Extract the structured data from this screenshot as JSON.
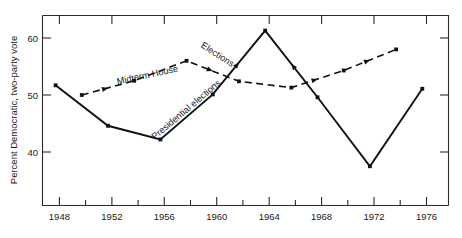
{
  "chart_data": {
    "type": "line",
    "title": "",
    "xlabel": "",
    "ylabel": "Percent Democratic, two-party vote",
    "xlim": [
      1947,
      1978
    ],
    "ylim": [
      35.5,
      63.5
    ],
    "grid": false,
    "legend": "inline-annotations",
    "x_major_ticks": [
      1948,
      1952,
      1956,
      1960,
      1964,
      1968,
      1972,
      1976
    ],
    "x_minor_ticks": [
      1950,
      1954,
      1958,
      1962,
      1966,
      1970,
      1974
    ],
    "x_tick_labels": [
      "1948",
      "1952",
      "1956",
      "1960",
      "1964",
      "1968",
      "1972",
      "1976"
    ],
    "y_ticks": [
      40,
      50,
      60
    ],
    "y_tick_labels": [
      "40",
      "50",
      "60"
    ],
    "series": [
      {
        "name": "Presidential elections",
        "style": "solid",
        "x": [
          1948,
          1952,
          1956,
          1960,
          1964,
          1968,
          1972,
          1976
        ],
        "values": [
          51.7,
          44.6,
          42.2,
          50.1,
          61.3,
          49.6,
          37.5,
          51.1
        ]
      },
      {
        "name": "Midterm House Elections",
        "style": "dashed",
        "x": [
          1950,
          1954,
          1958,
          1962,
          1966,
          1970,
          1974
        ],
        "values": [
          50.0,
          52.5,
          56.0,
          52.4,
          51.3,
          54.3,
          58.0
        ]
      }
    ],
    "annotations": [
      {
        "text": "Midterm House",
        "x": 148,
        "y": 78,
        "rotation": -12
      },
      {
        "text": "Elections",
        "x": 216,
        "y": 58,
        "rotation": 33
      },
      {
        "text": "Presidential elections",
        "x": 186,
        "y": 110,
        "rotation": -40
      }
    ]
  },
  "axis": {
    "y_title": "Percent Democratic, two-party vote"
  }
}
